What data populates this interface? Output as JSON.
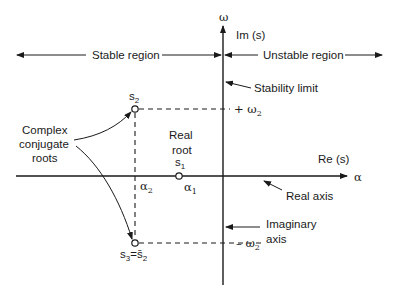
{
  "colors": {
    "ink": "#1a1a1a",
    "background": "#ffffff"
  },
  "axes": {
    "vertical_symbol": "ω",
    "vertical_label": "Im (s)",
    "horizontal_symbol": "α",
    "horizontal_label": "Re (s)"
  },
  "regions": {
    "stable": "Stable region",
    "unstable": "Unstable region"
  },
  "annotations": {
    "stability_limit": "Stability limit",
    "complex_line1": "Complex",
    "complex_line2": "conjugate",
    "complex_line3": "roots",
    "real_root_line1": "Real",
    "real_root_line2": "root",
    "real_axis": "Real axis",
    "imaginary_axis_line1": "Imaginary",
    "imaginary_axis_line2": "axis"
  },
  "points": {
    "s2": {
      "base": "s",
      "sub": "2"
    },
    "s1": {
      "base": "s",
      "sub": "1"
    },
    "s3": {
      "base": "s",
      "sub": "3",
      "eq": "=",
      "conj_base": "s̄",
      "conj_sub": "2"
    }
  },
  "ticks": {
    "alpha2": {
      "base": "α",
      "sub": "2"
    },
    "alpha1": {
      "base": "α",
      "sub": "1"
    },
    "plus_omega2": {
      "prefix": "+ ",
      "base": "ω",
      "sub": "2"
    },
    "minus_omega2": {
      "prefix": "– ",
      "base": "ω",
      "sub": "2"
    }
  }
}
